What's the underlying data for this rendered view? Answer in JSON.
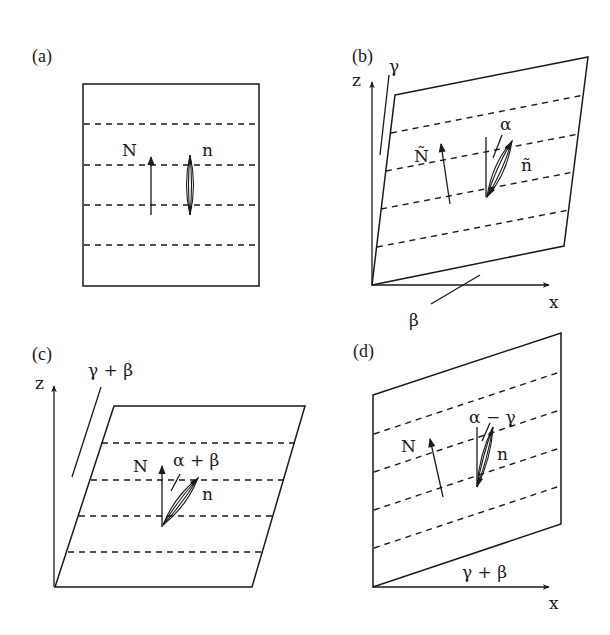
{
  "figure": {
    "colors": {
      "ink": "#1a1a1a",
      "background": "#ffffff"
    }
  },
  "panels": [
    {
      "id": "a",
      "label": "(a)",
      "vector_label": "N",
      "director_label": "n",
      "axes": []
    },
    {
      "id": "b",
      "label": "(b)",
      "vector_label": "Ñ",
      "director_label": "ñ",
      "angle_director": "α",
      "angle_z": "γ",
      "angle_x": "β",
      "axes": [
        "z",
        "x"
      ]
    },
    {
      "id": "c",
      "label": "(c)",
      "vector_label": "N",
      "director_label": "n",
      "angle_director": "α + β",
      "angle_z": "γ + β",
      "axes": [
        "z"
      ]
    },
    {
      "id": "d",
      "label": "(d)",
      "vector_label": "N",
      "director_label": "n",
      "angle_director": "α − γ",
      "angle_x": "γ + β",
      "axes": [
        "x"
      ]
    }
  ]
}
